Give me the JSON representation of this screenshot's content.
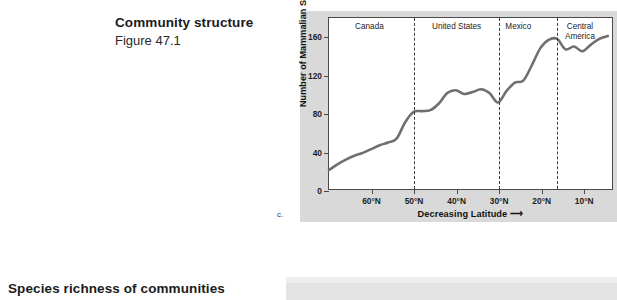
{
  "slide": {
    "heading_main": "Community structure",
    "heading_sub": "Figure 47.1",
    "bottom_heading": "Species richness of communities",
    "figure_letter": "c."
  },
  "chart_data": {
    "type": "line",
    "title": "",
    "xlabel": "Decreasing Latitude",
    "xlabel_arrow": "⟶",
    "ylabel": "Number of Mammalian Species",
    "ylim": [
      0,
      180
    ],
    "yticks": [
      0,
      40,
      80,
      120,
      160
    ],
    "ytick_labels": [
      "0",
      "40",
      "80",
      "120",
      "160"
    ],
    "xlim": [
      70,
      3
    ],
    "xticks": [
      60,
      50,
      40,
      30,
      20,
      10
    ],
    "xtick_labels": [
      "60°N",
      "50°N",
      "40°N",
      "30°N",
      "20°N",
      "10°N"
    ],
    "grid": false,
    "legend": "none",
    "line_color": "#6f6f6f",
    "line_width": 2.6,
    "regions": [
      {
        "label": "Canada",
        "center_lat": 60.5
      },
      {
        "label": "United States",
        "center_lat": 40.0
      },
      {
        "label": "Mexico",
        "center_lat": 25.5
      },
      {
        "label": "Central\nAmerica",
        "center_lat": 11.0
      }
    ],
    "dividers": [
      {
        "lat": 50.0
      },
      {
        "lat": 30.0
      },
      {
        "lat": 16.5
      }
    ],
    "series": [
      {
        "name": "Mammalian species richness",
        "x": [
          70,
          68,
          66,
          64,
          62,
          60,
          58,
          56,
          54,
          52,
          50,
          48,
          46,
          44,
          42,
          40,
          38,
          36,
          34,
          32,
          30,
          28,
          26,
          24,
          22,
          20,
          18,
          16,
          14,
          12,
          10,
          8,
          6,
          4
        ],
        "y": [
          20,
          26,
          31,
          35,
          38,
          42,
          46,
          49,
          53,
          70,
          81,
          82,
          83,
          90,
          101,
          104,
          100,
          102,
          105,
          101,
          91,
          103,
          112,
          114,
          130,
          148,
          157,
          158,
          147,
          150,
          145,
          152,
          158,
          161
        ]
      }
    ]
  }
}
